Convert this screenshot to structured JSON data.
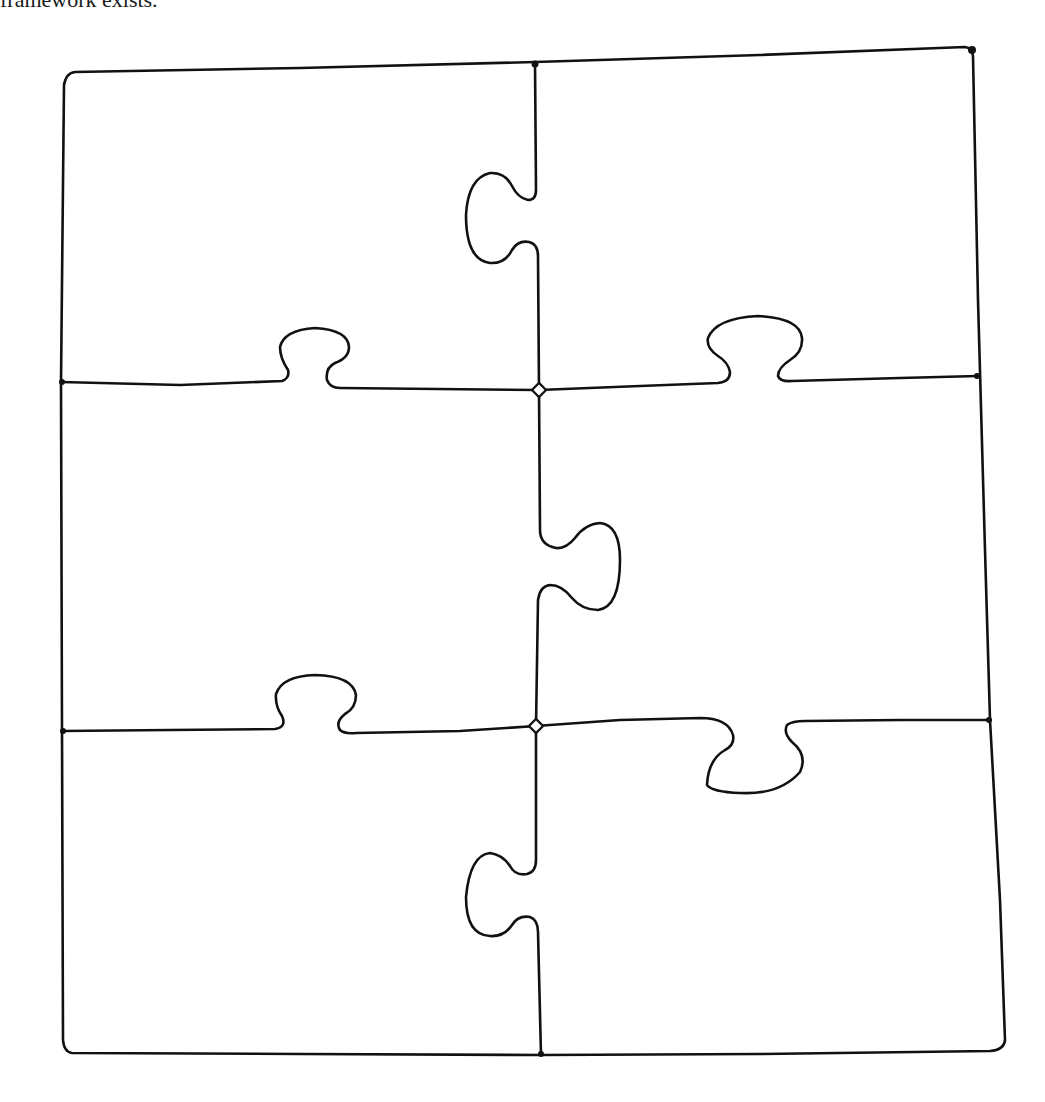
{
  "header_fragment": {
    "text": "framework exists."
  },
  "diagram": {
    "title": "",
    "type": "jigsaw-puzzle-outline",
    "grid": {
      "rows": 3,
      "columns": 2,
      "pieces": 6
    },
    "stroke_color": "#111111",
    "background_color": "#ffffff",
    "pieces": [
      {
        "id": "top-left",
        "row": 1,
        "col": 1,
        "right_edge": "blank (socket)",
        "bottom_edge": "tab up into this piece (socket)"
      },
      {
        "id": "top-right",
        "row": 1,
        "col": 2,
        "left_edge": "tab pointing left",
        "bottom_edge": "socket (tab from below)"
      },
      {
        "id": "middle-left",
        "row": 2,
        "col": 1,
        "top_edge": "tab pointing up",
        "right_edge": "tab pointing right",
        "bottom_edge": "socket"
      },
      {
        "id": "middle-right",
        "row": 2,
        "col": 2,
        "top_edge": "tab pointing up",
        "left_edge": "socket",
        "bottom_edge": "tab pointing down"
      },
      {
        "id": "bottom-left",
        "row": 3,
        "col": 1,
        "top_edge": "tab pointing up",
        "right_edge": "socket"
      },
      {
        "id": "bottom-right",
        "row": 3,
        "col": 2,
        "top_edge": "socket",
        "left_edge": "tab pointing left"
      }
    ]
  }
}
